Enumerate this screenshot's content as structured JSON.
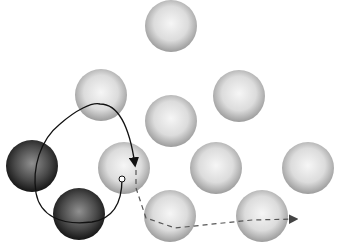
{
  "diagram": {
    "colors": {
      "light_sphere_edge": "#9a9a9a",
      "light_sphere_center": "#f4f4f4",
      "dark_sphere_edge": "#1e1e1e",
      "dark_sphere_center": "#8a8a8a",
      "path": "#111111",
      "dashed_path": "#555555"
    },
    "spheres": [
      {
        "cx": 171,
        "cy": 26,
        "r": 26,
        "shade": "light"
      },
      {
        "cx": 101,
        "cy": 95,
        "r": 26,
        "shade": "light"
      },
      {
        "cx": 239,
        "cy": 96,
        "r": 26,
        "shade": "light"
      },
      {
        "cx": 171,
        "cy": 121,
        "r": 26,
        "shade": "light"
      },
      {
        "cx": 32,
        "cy": 166,
        "r": 26,
        "shade": "dark"
      },
      {
        "cx": 124,
        "cy": 168,
        "r": 26,
        "shade": "light"
      },
      {
        "cx": 216,
        "cy": 168,
        "r": 26,
        "shade": "light"
      },
      {
        "cx": 308,
        "cy": 168,
        "r": 26,
        "shade": "light"
      },
      {
        "cx": 79,
        "cy": 214,
        "r": 26,
        "shade": "dark"
      },
      {
        "cx": 170,
        "cy": 216,
        "r": 26,
        "shade": "light"
      },
      {
        "cx": 262,
        "cy": 216,
        "r": 26,
        "shade": "light"
      }
    ],
    "solid_path": "M122,179 C122,195 118,218 92,222 C60,226 40,215 36,193 C32,168 40,140 60,124 C76,110 92,102 100,104 C120,104 130,130 135,165",
    "dashed_path": "M136,170 L136,188 L146,218 L175,228 L252,220 L296,219",
    "start_marker": {
      "cx": 122,
      "cy": 179,
      "r": 3
    }
  }
}
